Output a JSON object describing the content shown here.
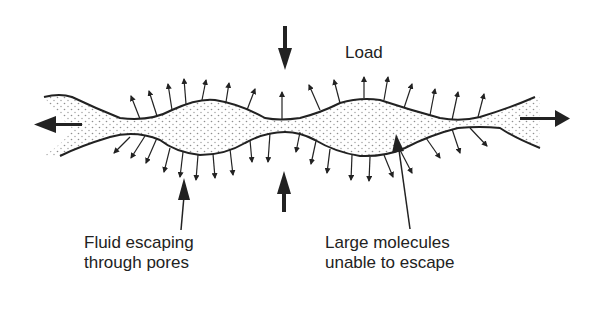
{
  "diagram": {
    "labels": {
      "load": "Load",
      "fluid_line1": "Fluid escaping",
      "fluid_line2": "through pores",
      "molecules_line1": "Large molecules",
      "molecules_line2": "unable to escape"
    },
    "colors": {
      "ink": "#222222",
      "background": "#ffffff"
    },
    "elements": [
      {
        "name": "load-arrow-top",
        "direction": "down"
      },
      {
        "name": "load-arrow-bottom",
        "direction": "up"
      },
      {
        "name": "flow-arrow-left",
        "direction": "left"
      },
      {
        "name": "flow-arrow-right",
        "direction": "right"
      },
      {
        "name": "pore-arrows",
        "direction": "outward"
      }
    ]
  }
}
